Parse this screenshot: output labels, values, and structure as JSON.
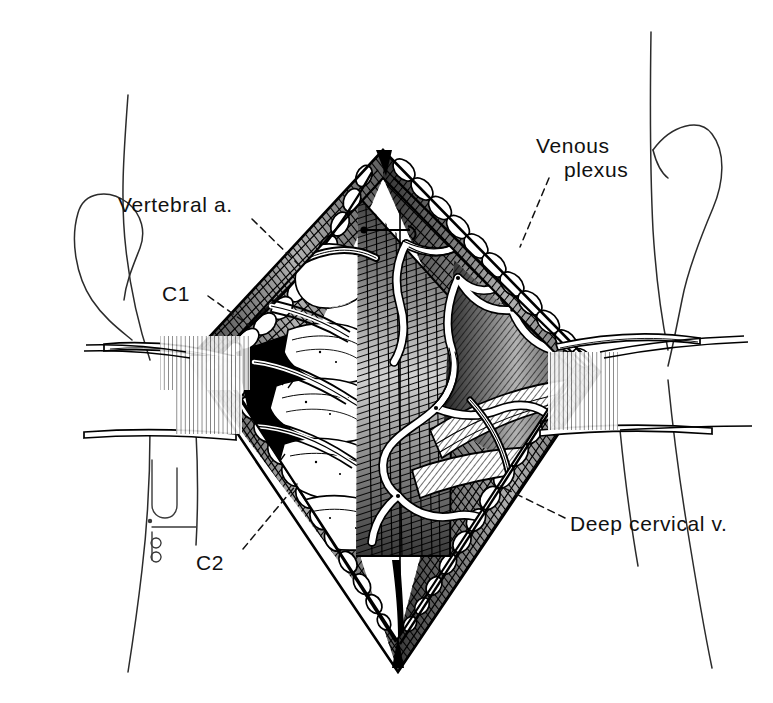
{
  "figure": {
    "kind": "medical-line-illustration",
    "technique": "pen-and-ink stipple and hatch engraving",
    "view": "posterior surgical exposure of the upper cervical spine",
    "background_color": "#ffffff",
    "ink_color": "#000000",
    "label_color": "#111111"
  },
  "labels": {
    "vertebral_artery": "Vertebral a.",
    "c1": "C1",
    "venous_plexus_line1": "Venous",
    "venous_plexus_line2": "plexus",
    "c2": "C2",
    "deep_cervical_vein": "Deep cervical v."
  },
  "leaders": {
    "vertebral_artery": {
      "style": "dashed",
      "from": [
        252,
        219
      ],
      "to": [
        296,
        262
      ]
    },
    "c1": {
      "style": "dashed",
      "from": [
        205,
        300
      ],
      "to": [
        244,
        324
      ]
    },
    "venous_plexus": {
      "style": "dashed",
      "from": [
        547,
        175
      ],
      "to": [
        519,
        243
      ]
    },
    "c2": {
      "style": "dashed",
      "from": [
        243,
        552
      ],
      "to": [
        295,
        487
      ]
    },
    "deep_cervical_vein": {
      "style": "dashed",
      "from": [
        566,
        520
      ],
      "to": [
        503,
        487
      ]
    }
  },
  "anatomy": {
    "structures": [
      "Vertebral artery",
      "C1 posterior arch",
      "C2 vertebra / lamina",
      "Suboccipital venous plexus",
      "Deep cervical vein",
      "Semispinalis and suboccipital musculature",
      "Subcutaneous fat globules along wound margin"
    ],
    "instruments": [
      "Self-retaining retractor blade (superior)",
      "Self-retaining retractor blade (inferior)",
      "Small hand-held retractor outline (left margin)"
    ]
  },
  "composition": {
    "wound_shape": "vertical diamond / rhomboid midline exposure",
    "wound_apex_top": [
      383,
      150
    ],
    "wound_apex_bottom": [
      398,
      672
    ],
    "wound_left_vertex": [
      188,
      360
    ],
    "wound_right_vertex": [
      600,
      372
    ],
    "head_outline": "patient neck and both ear contours drawn in light outline at the periphery"
  }
}
